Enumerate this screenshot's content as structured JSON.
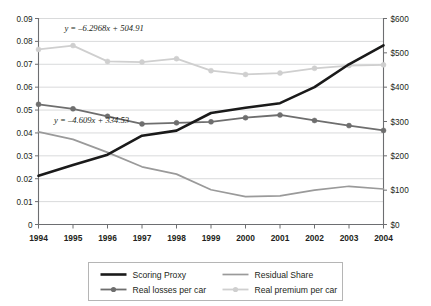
{
  "chart_data": {
    "type": "line",
    "title": "",
    "subtitle": "",
    "xlabel": "",
    "ylabel": "",
    "grid": true,
    "legend_position": "bottom",
    "categories": [
      "1994",
      "1995",
      "1996",
      "1997",
      "1998",
      "1999",
      "2000",
      "2001",
      "2002",
      "2003",
      "2004"
    ],
    "x_tick_labels": [
      "1994",
      "1995",
      "1996",
      "1997",
      "1998",
      "1999",
      "2000",
      "2001",
      "2002",
      "2003",
      "2004"
    ],
    "y_left": {
      "label": "",
      "ylim": [
        0,
        0.09
      ],
      "tick_values": [
        0,
        0.01,
        0.02,
        0.03,
        0.04,
        0.05,
        0.06,
        0.07,
        0.08,
        0.09
      ],
      "tick_labels": [
        "0",
        "0.01",
        "0.02",
        "0.03",
        "0.04",
        "0.05",
        "0.06",
        "0.07",
        "0.08",
        "0.09"
      ]
    },
    "y_right": {
      "label": "",
      "ylim": [
        0,
        600
      ],
      "tick_values": [
        0,
        100,
        200,
        300,
        400,
        500,
        600
      ],
      "tick_labels": [
        "$0",
        "$100",
        "$200",
        "$300",
        "$400",
        "$500",
        "$600"
      ]
    },
    "series": [
      {
        "name": "Scoring Proxy",
        "axis": "left",
        "color": "#1a1a1a",
        "width": 2.6,
        "markers": false,
        "values": [
          0.0213,
          0.026,
          0.0305,
          0.0388,
          0.041,
          0.0487,
          0.051,
          0.053,
          0.06,
          0.07,
          0.0783
        ]
      },
      {
        "name": "Residual Share",
        "axis": "left",
        "color": "#9a9a9a",
        "width": 1.7,
        "markers": false,
        "values": [
          0.0405,
          0.0372,
          0.0315,
          0.0252,
          0.022,
          0.0152,
          0.0122,
          0.0125,
          0.015,
          0.0167,
          0.0155
        ]
      },
      {
        "name": "Real losses per car",
        "axis": "right",
        "color": "#6e6e6e",
        "width": 1.8,
        "markers": true,
        "values": [
          350,
          337,
          315,
          293,
          296,
          299,
          311,
          319,
          303,
          288,
          274
        ]
      },
      {
        "name": "Real premium per car",
        "axis": "right",
        "color": "#cfcfcf",
        "width": 1.8,
        "markers": true,
        "values": [
          510,
          521,
          475,
          473,
          483,
          448,
          437,
          441,
          455,
          463,
          465
        ]
      }
    ],
    "annotations": [
      {
        "text": "y = –6.2968x + 504.91",
        "x_frac": 0.075,
        "y_px": 31
      },
      {
        "text": "y = –4.609x + 334.53",
        "x_frac": 0.045,
        "y_px": 123
      }
    ]
  },
  "legend": {
    "entries": [
      {
        "label": "Scoring Proxy",
        "color": "#1a1a1a",
        "width": 2.6,
        "marker": false
      },
      {
        "label": "Residual Share",
        "color": "#9a9a9a",
        "width": 1.7,
        "marker": false
      },
      {
        "label": "Real losses per car",
        "color": "#6e6e6e",
        "width": 1.8,
        "marker": true
      },
      {
        "label": "Real premium per car",
        "color": "#cfcfcf",
        "width": 1.8,
        "marker": true
      }
    ]
  },
  "style": {
    "background": "#ffffff",
    "axis_color": "#6d6e71",
    "grid_color": "#d9dadb",
    "text_color": "#231f20",
    "legend_border": "#b5b5b5"
  }
}
